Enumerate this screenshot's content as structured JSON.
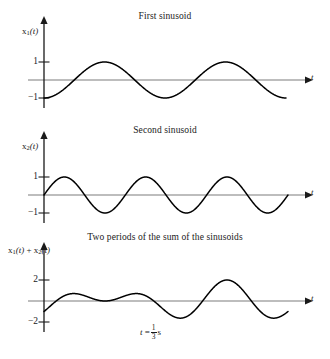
{
  "figure": {
    "panels": [
      {
        "id": "panel-0",
        "title": "First sinusoid",
        "ylabel_main": "x",
        "ylabel_sub": "1",
        "ylabel_rest": "(t)",
        "xlabel": "t",
        "tick_top": "1",
        "tick_bottom": "−1"
      },
      {
        "id": "panel-1",
        "title": "Second sinusoid",
        "ylabel_main": "x",
        "ylabel_sub": "2",
        "ylabel_rest": "(t)",
        "xlabel": "t",
        "tick_top": "1",
        "tick_bottom": "−1"
      },
      {
        "id": "panel-2",
        "title": "Two periods of the sum of the sinusoids",
        "ylabel_main": "x",
        "ylabel_sub": "1",
        "ylabel_rest": "(t)",
        "ylabel_main2": "x",
        "ylabel_sub2": "2",
        "ylabel_rest2": "(t)",
        "ylabel_plus": "+",
        "xlabel": "t",
        "tick_top": "2",
        "tick_bottom": "−2",
        "annotation_prefix": "t",
        "annotation_eq": "=",
        "annotation_num": "1",
        "annotation_den": "3",
        "annotation_unit": "s"
      }
    ],
    "colors": {
      "curve": "#000000",
      "axis": "#7d7d7d",
      "axis_vertical": "#1a1a1a",
      "text": "#1a1a1a",
      "background": "#ffffff"
    }
  },
  "chart_data": [
    {
      "type": "line",
      "title": "First sinusoid",
      "xlabel": "t",
      "ylabel": "x1(t)",
      "ylim": [
        -1.35,
        1.35
      ],
      "yticks": [
        -1,
        1
      ],
      "ytick_labels": [
        "−1",
        "1"
      ],
      "grid": false,
      "legend": "none",
      "waveform": {
        "formula": "-cos(2*pi*f1*t)",
        "amplitude": 1.0,
        "cycles_shown": 4.2,
        "phase_deg": 180,
        "starts_at": -1,
        "frequency_ratio": 2
      }
    },
    {
      "type": "line",
      "title": "Second sinusoid",
      "xlabel": "t",
      "ylabel": "x2(t)",
      "ylim": [
        -1.35,
        1.35
      ],
      "yticks": [
        -1,
        1
      ],
      "ytick_labels": [
        "−1",
        "1"
      ],
      "grid": false,
      "legend": "none",
      "waveform": {
        "formula": "sin(2*pi*f2*t)",
        "amplitude": 1.0,
        "cycles_shown": 6.3,
        "phase_deg": 0,
        "starts_at": 0,
        "frequency_ratio": 3
      }
    },
    {
      "type": "line",
      "title": "Two periods of the sum of the sinusoids",
      "xlabel": "t",
      "ylabel": "x1(t) + x2(t)",
      "ylim": [
        -2.6,
        2.6
      ],
      "yticks": [
        -2,
        2
      ],
      "ytick_labels": [
        "−2",
        "2"
      ],
      "grid": false,
      "legend": "none",
      "annotation": "t = 1/3 s",
      "waveform": {
        "formula": "-cos(2*pi*f1*t) + sin(2*pi*f2*t)",
        "amplitude": 2.0,
        "periods_shown": 2.1,
        "starts_at": -1,
        "components": [
          {
            "name": "x1",
            "frequency_ratio": 2,
            "amplitude": 1.0,
            "phase_deg": 180
          },
          {
            "name": "x2",
            "frequency_ratio": 3,
            "amplitude": 1.0,
            "phase_deg": 0
          }
        ]
      }
    }
  ]
}
